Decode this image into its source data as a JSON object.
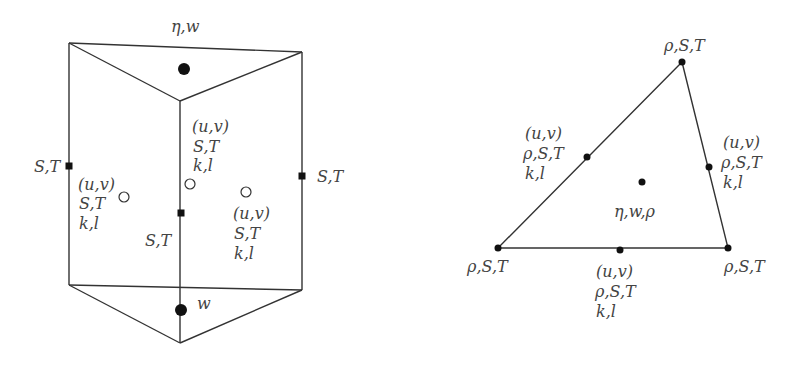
{
  "prism": {
    "top_label": "η,w",
    "bottom_label": "w",
    "left_edge_label": "S,T",
    "right_edge_label": "S,T",
    "center_edge_label": "S,T",
    "left_face": {
      "l1": "(u,v)",
      "l2": "S,T",
      "l3": "k,l"
    },
    "back_face": {
      "l1": "(u,v)",
      "l2": "S,T",
      "l3": "k,l"
    },
    "right_face": {
      "l1": "(u,v)",
      "l2": "S,T",
      "l3": "k,l"
    }
  },
  "triangle": {
    "top_vertex": "ρ,S,T",
    "left_vertex": "ρ,S,T",
    "right_vertex": "ρ,S,T",
    "center": "η,w,ρ",
    "left_mid": {
      "l1": "(u,v)",
      "l2": "ρ,S,T",
      "l3": "k,l"
    },
    "right_mid": {
      "l1": "(u,v)",
      "l2": "ρ,S,T",
      "l3": "k,l"
    },
    "bottom_mid": {
      "l1": "(u,v)",
      "l2": "ρ,S,T",
      "l3": "k,l"
    }
  },
  "colors": {
    "line": "#333333",
    "text": "#444444"
  }
}
